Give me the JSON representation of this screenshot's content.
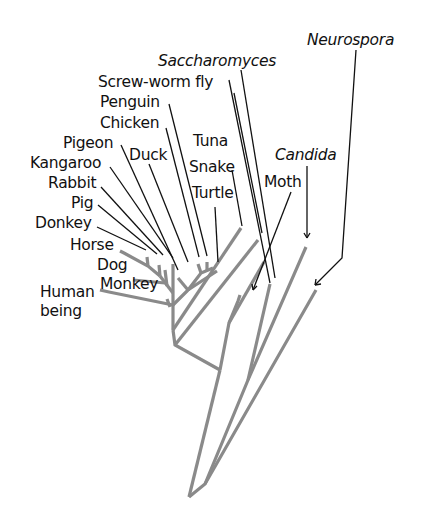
{
  "diagram": {
    "type": "phylogenetic-tree",
    "colors": {
      "branch": "#8a8a8a",
      "leader": "#111111",
      "text": "#111111"
    },
    "labels": {
      "neurospora": "Neurospora",
      "saccharomyces": "Saccharomyces",
      "screwworm": "Screw-worm fly",
      "penguin": "Penguin",
      "chicken": "Chicken",
      "pigeon": "Pigeon",
      "duck": "Duck",
      "kangaroo": "Kangaroo",
      "rabbit": "Rabbit",
      "pig": "Pig",
      "donkey": "Donkey",
      "horse": "Horse",
      "dog": "Dog",
      "monkey": "Monkey",
      "human_line1": "Human",
      "human_line2": "being",
      "tuna": "Tuna",
      "snake": "Snake",
      "turtle": "Turtle",
      "candida": "Candida",
      "moth": "Moth"
    },
    "italic_taxa": [
      "Neurospora",
      "Saccharomyces",
      "Candida"
    ]
  }
}
